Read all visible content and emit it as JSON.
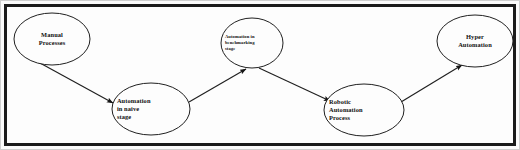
{
  "diagram": {
    "background_color": "#fdfdfd",
    "frame_color": "#1b1b1b",
    "node_stroke_color": "#202020",
    "edge_color": "#202020",
    "nodes": [
      {
        "id": "manual-processes",
        "label": "Manual\nProcesses",
        "shape": "ellipse",
        "cx": 52,
        "cy": 39,
        "rx": 38,
        "ry": 26,
        "text_size": "normal",
        "text_align": "centered"
      },
      {
        "id": "automation-naive-stage",
        "label": "Automation\nin naive\nstage",
        "shape": "ellipse",
        "cx": 151,
        "cy": 109,
        "rx": 39,
        "ry": 26,
        "text_size": "normal",
        "text_align": "left"
      },
      {
        "id": "automation-benchmarking-stage",
        "label": "Automation in\nbenchmarking\nstage",
        "shape": "ellipse",
        "cx": 252,
        "cy": 43,
        "rx": 31,
        "ry": 25,
        "text_size": "small",
        "text_align": "left"
      },
      {
        "id": "robotic-automation-process",
        "label": "Robotic\nAutomation\nProcess",
        "shape": "ellipse",
        "cx": 364,
        "cy": 110,
        "rx": 40,
        "ry": 26,
        "text_size": "normal",
        "text_align": "left"
      },
      {
        "id": "hyper-automation",
        "label": "Hyper\nAutomation",
        "shape": "ellipse",
        "cx": 475,
        "cy": 41,
        "rx": 38,
        "ry": 26,
        "text_size": "normal",
        "text_align": "centered"
      }
    ],
    "edges": [
      {
        "id": "edge-manual-to-naive",
        "from": "manual-processes",
        "to": "automation-naive-stage",
        "x1": 40,
        "y1": 63,
        "x2": 113,
        "y2": 103,
        "direction": "down-right"
      },
      {
        "id": "edge-naive-to-benchmarking",
        "from": "automation-naive-stage",
        "to": "automation-benchmarking-stage",
        "x1": 189,
        "y1": 102,
        "x2": 246,
        "y2": 69,
        "direction": "up-right"
      },
      {
        "id": "edge-benchmarking-to-robotic",
        "from": "automation-benchmarking-stage",
        "to": "robotic-automation-process",
        "x1": 259,
        "y1": 68,
        "x2": 330,
        "y2": 101,
        "direction": "down-right"
      },
      {
        "id": "edge-robotic-to-hyper",
        "from": "robotic-automation-process",
        "to": "hyper-automation",
        "x1": 401,
        "y1": 102,
        "x2": 462,
        "y2": 65,
        "direction": "up-right"
      }
    ]
  }
}
